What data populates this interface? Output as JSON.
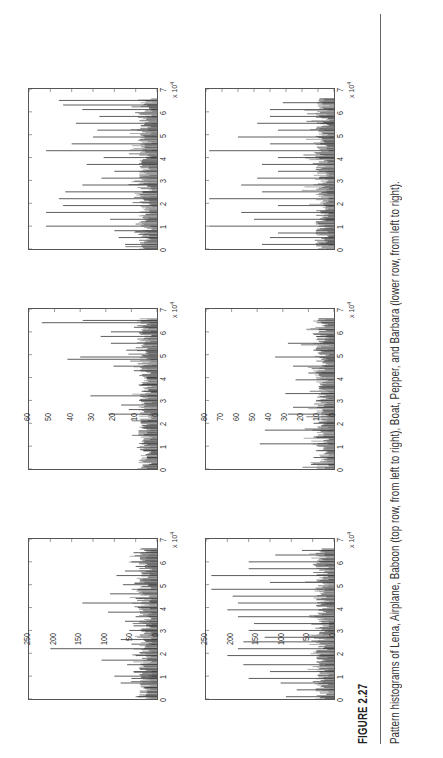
{
  "figure": {
    "label": "FIGURE 2.27",
    "caption": "Pattern histograms of Lena, Airplane, Baboon (top row, from left to right), Boat, Pepper, and Barbara (lower row, from left to right)."
  },
  "chart_data": [
    {
      "type": "bar",
      "title": "Lena",
      "position": "top row, left",
      "xlabel": "",
      "ylabel": "",
      "x_multiplier": "x 10^4",
      "xlim": [
        0,
        7
      ],
      "ylim": [
        0,
        300
      ],
      "xticks": [
        "0",
        "1",
        "2",
        "3",
        "4",
        "5",
        "6",
        "7"
      ],
      "yticks": [
        "0",
        "50",
        "100",
        "150",
        "200",
        "250",
        "300"
      ],
      "x": [
        0.1,
        0.3,
        0.5,
        0.7,
        0.9,
        1.0,
        1.2,
        1.5,
        1.7,
        1.9,
        2.2,
        2.4,
        2.6,
        2.8,
        3.0,
        3.2,
        3.4,
        3.6,
        3.8,
        4.0,
        4.2,
        4.4,
        4.6,
        4.8,
        5.0,
        5.2,
        5.4,
        5.6,
        5.8,
        6.0,
        6.2,
        6.4,
        6.5
      ],
      "values": [
        45,
        40,
        30,
        85,
        60,
        100,
        55,
        70,
        130,
        50,
        250,
        60,
        85,
        40,
        65,
        55,
        75,
        50,
        115,
        45,
        175,
        50,
        110,
        45,
        80,
        40,
        95,
        75,
        50,
        60,
        40,
        55,
        30
      ]
    },
    {
      "type": "bar",
      "title": "Airplane",
      "position": "top row, middle",
      "x_multiplier": "x 10^4",
      "xlim": [
        0,
        7
      ],
      "ylim": [
        0,
        250
      ],
      "xticks": [
        "0",
        "1",
        "2",
        "3",
        "4",
        "5",
        "6",
        "7"
      ],
      "yticks": [
        "0",
        "50",
        "100",
        "150",
        "200",
        "250"
      ],
      "x": [
        0.2,
        0.5,
        0.8,
        1.1,
        1.5,
        1.8,
        2.1,
        2.4,
        2.6,
        2.8,
        3.0,
        3.2,
        3.4,
        3.7,
        4.0,
        4.3,
        4.5,
        4.8,
        4.9,
        5.2,
        5.5,
        5.8,
        6.0,
        6.2,
        6.4,
        6.5
      ],
      "values": [
        15,
        20,
        25,
        30,
        25,
        30,
        30,
        95,
        55,
        70,
        35,
        130,
        30,
        30,
        20,
        45,
        85,
        175,
        150,
        60,
        90,
        110,
        90,
        45,
        225,
        145
      ]
    },
    {
      "type": "bar",
      "title": "Baboon",
      "position": "top row, right",
      "x_multiplier": "x 10^4",
      "xlim": [
        0,
        7
      ],
      "ylim": [
        0,
        60
      ],
      "xticks": [
        "0",
        "1",
        "2",
        "3",
        "4",
        "5",
        "6",
        "7"
      ],
      "yticks": [
        "0",
        "10",
        "20",
        "30",
        "40",
        "50",
        "60"
      ],
      "x": [
        0.2,
        0.5,
        0.8,
        1.0,
        1.3,
        1.6,
        1.9,
        2.2,
        2.5,
        2.8,
        3.1,
        3.4,
        3.7,
        4.0,
        4.3,
        4.6,
        4.9,
        5.2,
        5.5,
        5.8,
        6.1,
        6.3,
        6.5
      ],
      "values": [
        15,
        18,
        20,
        52,
        22,
        52,
        44,
        46,
        43,
        35,
        26,
        20,
        33,
        25,
        52,
        40,
        30,
        28,
        38,
        27,
        35,
        44,
        46
      ]
    },
    {
      "type": "bar",
      "title": "Boat",
      "position": "lower row, left",
      "x_multiplier": "x 10^4",
      "xlim": [
        0,
        7
      ],
      "ylim": [
        0,
        120
      ],
      "xticks": [
        "0",
        "1",
        "2",
        "3",
        "4",
        "5",
        "6",
        "7"
      ],
      "yticks": [
        "0",
        "20",
        "40",
        "60",
        "80",
        "100",
        "120"
      ],
      "x": [
        0.1,
        0.4,
        0.7,
        0.9,
        1.2,
        1.5,
        1.9,
        2.2,
        2.5,
        2.7,
        3.0,
        3.3,
        3.6,
        3.9,
        4.2,
        4.5,
        4.8,
        5.1,
        5.4,
        5.7,
        6.0,
        6.3,
        6.5
      ],
      "values": [
        45,
        35,
        50,
        80,
        60,
        85,
        100,
        90,
        85,
        65,
        80,
        75,
        90,
        100,
        90,
        95,
        115,
        60,
        115,
        80,
        80,
        55,
        30
      ]
    },
    {
      "type": "bar",
      "title": "Pepper",
      "position": "lower row, middle",
      "x_multiplier": "x 10^4",
      "xlim": [
        0,
        7
      ],
      "ylim": [
        0,
        250
      ],
      "xticks": [
        "0",
        "1",
        "2",
        "3",
        "4",
        "5",
        "6",
        "7"
      ],
      "yticks": [
        "0",
        "50",
        "100",
        "150",
        "200",
        "250"
      ],
      "x": [
        0.2,
        0.5,
        0.8,
        1.1,
        1.4,
        1.7,
        2.0,
        2.4,
        2.7,
        3.0,
        3.3,
        3.6,
        3.9,
        4.2,
        4.5,
        4.9,
        5.2,
        5.5,
        5.8,
        6.1,
        6.4
      ],
      "values": [
        45,
        40,
        35,
        145,
        40,
        135,
        40,
        90,
        80,
        35,
        95,
        30,
        75,
        50,
        80,
        115,
        40,
        90,
        35,
        30,
        25
      ]
    },
    {
      "type": "bar",
      "title": "Barbara",
      "position": "lower row, right",
      "x_multiplier": "x 10^4",
      "xlim": [
        0,
        7
      ],
      "ylim": [
        0,
        80
      ],
      "xticks": [
        "0",
        "1",
        "2",
        "3",
        "4",
        "5",
        "6",
        "7"
      ],
      "yticks": [
        "0",
        "10",
        "20",
        "30",
        "40",
        "50",
        "60",
        "70",
        "80"
      ],
      "x": [
        0.2,
        0.5,
        0.7,
        1.0,
        1.3,
        1.6,
        1.9,
        2.2,
        2.5,
        2.8,
        3.1,
        3.4,
        3.7,
        4.0,
        4.3,
        4.6,
        4.9,
        5.2,
        5.5,
        5.8,
        6.1,
        6.4
      ],
      "values": [
        45,
        40,
        35,
        78,
        50,
        58,
        35,
        78,
        45,
        58,
        48,
        35,
        45,
        35,
        78,
        40,
        60,
        35,
        48,
        40,
        40,
        32
      ]
    }
  ]
}
